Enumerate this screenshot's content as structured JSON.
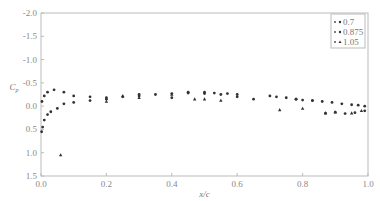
{
  "chart_data": {
    "type": "scatter",
    "title": "",
    "xlabel": "x/c",
    "ylabel": "C_p",
    "xlim": [
      0.0,
      1.0
    ],
    "ylim": [
      -2.0,
      1.5
    ],
    "y_inverted": true,
    "x_ticks": [
      "0.0",
      "0.2",
      "0.4",
      "0.6",
      "0.8",
      "1.0"
    ],
    "y_ticks": [
      "-2.0",
      "-1.5",
      "-1.0",
      "-0.5",
      "0.0",
      "0.5",
      "1.0",
      "1.5"
    ],
    "grid": false,
    "legend_position": "upper right",
    "series": [
      {
        "name": "0.7",
        "marker": "dot",
        "points": [
          [
            0.002,
            0.55
          ],
          [
            0.005,
            0.45
          ],
          [
            0.01,
            0.3
          ],
          [
            0.02,
            0.18
          ],
          [
            0.03,
            0.12
          ],
          [
            0.05,
            0.05
          ],
          [
            0.07,
            -0.05
          ],
          [
            0.1,
            -0.08
          ],
          [
            0.15,
            -0.12
          ],
          [
            0.2,
            -0.15
          ],
          [
            0.25,
            -0.2
          ],
          [
            0.3,
            -0.22
          ],
          [
            0.35,
            -0.25
          ],
          [
            0.4,
            -0.27
          ],
          [
            0.45,
            -0.28
          ],
          [
            0.5,
            -0.27
          ],
          [
            0.55,
            -0.25
          ],
          [
            0.6,
            -0.2
          ],
          [
            0.65,
            -0.15
          ],
          [
            0.7,
            -0.22
          ],
          [
            0.75,
            -0.18
          ],
          [
            0.78,
            -0.15
          ],
          [
            0.8,
            -0.13
          ],
          [
            0.83,
            -0.12
          ],
          [
            0.86,
            -0.1
          ],
          [
            0.89,
            -0.08
          ],
          [
            0.92,
            -0.05
          ],
          [
            0.95,
            -0.03
          ],
          [
            0.97,
            -0.02
          ],
          [
            0.99,
            0.0
          ]
        ]
      },
      {
        "name": "0.875",
        "marker": "dot",
        "points": [
          [
            0.003,
            -0.1
          ],
          [
            0.01,
            -0.22
          ],
          [
            0.02,
            -0.3
          ],
          [
            0.04,
            -0.35
          ],
          [
            0.07,
            -0.3
          ],
          [
            0.1,
            -0.22
          ],
          [
            0.15,
            -0.2
          ],
          [
            0.2,
            -0.18
          ],
          [
            0.3,
            -0.25
          ],
          [
            0.4,
            -0.18
          ],
          [
            0.45,
            -0.3
          ],
          [
            0.5,
            -0.3
          ],
          [
            0.53,
            -0.28
          ],
          [
            0.57,
            -0.27
          ],
          [
            0.6,
            -0.25
          ],
          [
            0.72,
            -0.2
          ],
          [
            0.78,
            -0.15
          ],
          [
            0.83,
            -0.12
          ],
          [
            0.87,
            0.15
          ],
          [
            0.9,
            0.13
          ],
          [
            0.93,
            0.16
          ],
          [
            0.96,
            0.14
          ],
          [
            0.99,
            0.1
          ]
        ]
      },
      {
        "name": "1.05",
        "marker": "triangle",
        "points": [
          [
            0.06,
            1.05
          ],
          [
            0.2,
            -0.1
          ],
          [
            0.25,
            -0.22
          ],
          [
            0.3,
            -0.18
          ],
          [
            0.4,
            -0.25
          ],
          [
            0.47,
            -0.15
          ],
          [
            0.5,
            -0.15
          ],
          [
            0.55,
            -0.12
          ],
          [
            0.73,
            0.08
          ],
          [
            0.8,
            0.05
          ],
          [
            0.87,
            0.15
          ],
          [
            0.9,
            0.13
          ],
          [
            0.95,
            0.15
          ],
          [
            0.98,
            0.1
          ]
        ]
      }
    ]
  }
}
